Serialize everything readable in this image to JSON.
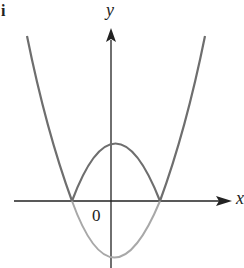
{
  "figure": {
    "corner_label": "i",
    "x_axis_label": "x",
    "y_axis_label": "y",
    "origin_label": "0",
    "colors": {
      "axes": "#222222",
      "outer_parabola": "#6e6e6e",
      "arch": "#6e6e6e",
      "lower_parabola": "#a8a8a8"
    },
    "curves": [
      {
        "name": "outer-parabola",
        "description": "upward parabola |x^2 - c| outer branches"
      },
      {
        "name": "upper-arch",
        "description": "reflected portion between roots, above x-axis"
      },
      {
        "name": "lower-parabola",
        "description": "original parabola portion below x-axis (lighter)"
      }
    ]
  }
}
